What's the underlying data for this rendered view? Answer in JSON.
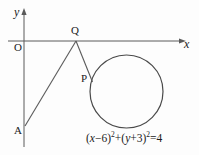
{
  "figure": {
    "type": "geometry-diagram",
    "background_color": "#fdfdfd",
    "stroke_color": "#555555",
    "text_color": "#1a1a1a",
    "axes": {
      "x_label": "x",
      "y_label": "y",
      "origin_label": "O",
      "x_axis_y_px": 41,
      "y_axis_x_px": 24
    },
    "points": [
      {
        "name": "Q",
        "label": "Q",
        "x_px": 76,
        "y_px": 41
      },
      {
        "name": "P",
        "label": "P",
        "x_px": 92,
        "y_px": 80
      },
      {
        "name": "A",
        "label": "A",
        "x_px": 25,
        "y_px": 126
      }
    ],
    "segments": [
      {
        "name": "segment-AQ",
        "from": "A",
        "to": "Q"
      },
      {
        "name": "segment-QP",
        "from": "Q",
        "to": "P"
      }
    ],
    "circle": {
      "center_x_px": 126.5,
      "center_y_px": 91.5,
      "radius_px": 36.5,
      "equation_parts": {
        "open1": "(",
        "var_x": "x",
        "minus_six": "−6",
        "close1": ")",
        "sup1": "2",
        "plus": "+",
        "open2": "(",
        "var_y": "y",
        "plus_three": "+3",
        "close2": ")",
        "sup2": "2",
        "equals_four": "=4"
      },
      "equation_text": "(x−6)²+(y+3)²=4"
    }
  }
}
